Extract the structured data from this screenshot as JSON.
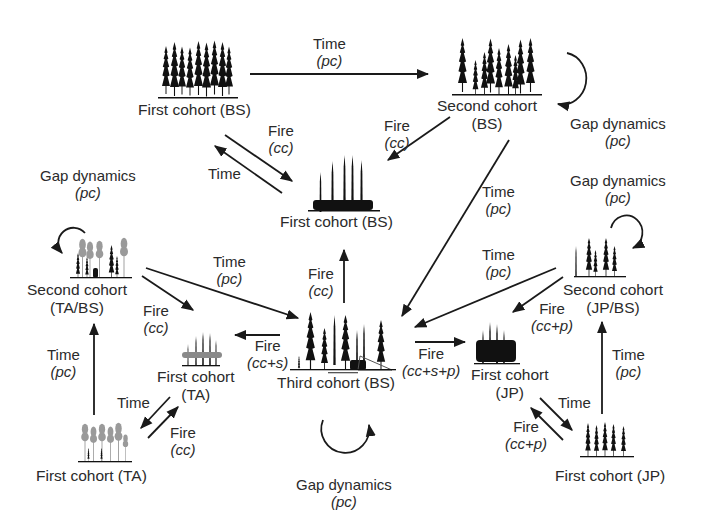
{
  "diagram": {
    "type": "state-transition",
    "legend_codes": {
      "BS": "black spruce",
      "TA": "trembling aspen",
      "JP": "jack pine",
      "pc": "partial cut",
      "cc": "clear cut",
      "s": "s",
      "p": "p"
    },
    "colors": {
      "line": "#1a1a1a",
      "text": "#2a2a2a",
      "tree_dark": "#111111",
      "tree_light": "#9a9a9a"
    }
  },
  "nodes": {
    "first_bs_top": {
      "line1": "First cohort (BS)",
      "line2": ""
    },
    "second_bs": {
      "line1": "Second cohort",
      "line2": "(BS)"
    },
    "first_bs_burnt": {
      "line1": "First cohort (BS)",
      "line2": ""
    },
    "second_tabs": {
      "line1": "Second cohort",
      "line2": "(TA/BS)"
    },
    "first_ta_burnt": {
      "line1": "First cohort",
      "line2": "(TA)"
    },
    "third_bs": {
      "line1": "Third cohort (BS)",
      "line2": ""
    },
    "first_jp_burnt": {
      "line1": "First cohort",
      "line2": "(JP)"
    },
    "second_jpbs": {
      "line1": "Second cohort",
      "line2": "(JP/BS)"
    },
    "first_ta": {
      "line1": "First cohort (TA)",
      "line2": ""
    },
    "first_jp": {
      "line1": "First cohort (JP)",
      "line2": ""
    }
  },
  "edges": [
    {
      "id": "e1",
      "from": "first_bs_top",
      "to": "second_bs",
      "label": "Time",
      "sub": "(pc)"
    },
    {
      "id": "e2",
      "from": "first_bs_top",
      "to": "first_bs_burnt",
      "label": "Fire",
      "sub": "(cc)"
    },
    {
      "id": "e3",
      "from": "first_bs_burnt",
      "to": "first_bs_top",
      "label": "Time",
      "sub": ""
    },
    {
      "id": "e4",
      "from": "second_bs",
      "to": "first_bs_burnt",
      "label": "Fire",
      "sub": "(cc)"
    },
    {
      "id": "e5",
      "from": "second_bs",
      "to": "second_bs",
      "label": "Gap dynamics",
      "sub": "(pc)"
    },
    {
      "id": "e6",
      "from": "second_bs",
      "to": "third_bs",
      "label": "Time",
      "sub": "(pc)"
    },
    {
      "id": "e7",
      "from": "third_bs",
      "to": "first_bs_burnt",
      "label": "Fire",
      "sub": "(cc)"
    },
    {
      "id": "e8",
      "from": "second_tabs",
      "to": "second_tabs",
      "label": "Gap dynamics",
      "sub": "(pc)"
    },
    {
      "id": "e9",
      "from": "second_tabs",
      "to": "third_bs",
      "label": "Time",
      "sub": "(pc)"
    },
    {
      "id": "e10",
      "from": "second_tabs",
      "to": "first_ta_burnt",
      "label": "Fire",
      "sub": "(cc)"
    },
    {
      "id": "e11",
      "from": "third_bs",
      "to": "first_ta_burnt",
      "label": "Fire",
      "sub": "(cc+s)"
    },
    {
      "id": "e12",
      "from": "third_bs",
      "to": "first_jp_burnt",
      "label": "Fire",
      "sub": "(cc+s+p)"
    },
    {
      "id": "e13",
      "from": "third_bs",
      "to": "third_bs",
      "label": "Gap dynamics",
      "sub": "(pc)"
    },
    {
      "id": "e14",
      "from": "second_jpbs",
      "to": "second_jpbs",
      "label": "Gap dynamics",
      "sub": "(pc)"
    },
    {
      "id": "e15",
      "from": "second_jpbs",
      "to": "third_bs",
      "label": "Time",
      "sub": "(pc)"
    },
    {
      "id": "e16",
      "from": "second_jpbs",
      "to": "first_jp_burnt",
      "label": "Fire",
      "sub": "(cc+p)"
    },
    {
      "id": "e17",
      "from": "first_ta",
      "to": "second_tabs",
      "label": "Time",
      "sub": "(pc)"
    },
    {
      "id": "e18",
      "from": "first_ta_burnt",
      "to": "first_ta",
      "label": "Time",
      "sub": ""
    },
    {
      "id": "e19",
      "from": "first_ta",
      "to": "first_ta_burnt",
      "label": "Fire",
      "sub": "(cc)"
    },
    {
      "id": "e20",
      "from": "first_jp",
      "to": "second_jpbs",
      "label": "Time",
      "sub": "(pc)"
    },
    {
      "id": "e21",
      "from": "first_jp_burnt",
      "to": "first_jp",
      "label": "Time",
      "sub": ""
    },
    {
      "id": "e22",
      "from": "first_jp",
      "to": "first_jp_burnt",
      "label": "Fire",
      "sub": "(cc+p)"
    }
  ]
}
